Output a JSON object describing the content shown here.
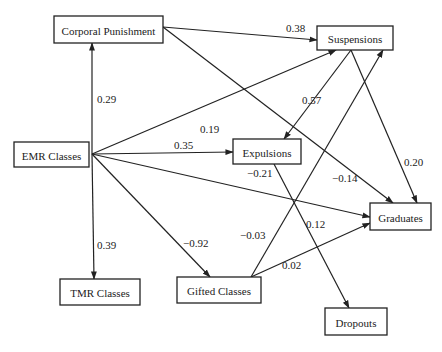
{
  "diagram": {
    "type": "path-diagram",
    "nodes": [
      {
        "id": "corporal",
        "label": "Corporal Punishment"
      },
      {
        "id": "suspensions",
        "label": "Suspensions"
      },
      {
        "id": "emr",
        "label": "EMR Classes"
      },
      {
        "id": "expulsions",
        "label": "Expulsions"
      },
      {
        "id": "graduates",
        "label": "Graduates"
      },
      {
        "id": "tmr",
        "label": "TMR Classes"
      },
      {
        "id": "gifted",
        "label": "Gifted Classes"
      },
      {
        "id": "dropouts",
        "label": "Dropouts"
      }
    ],
    "edges": [
      {
        "from": "emr",
        "to": "corporal",
        "label": "0.29"
      },
      {
        "from": "corporal",
        "to": "suspensions",
        "label": "0.38"
      },
      {
        "from": "emr",
        "to": "suspensions",
        "label": "0.19"
      },
      {
        "from": "emr",
        "to": "expulsions",
        "label": "0.35"
      },
      {
        "from": "suspensions",
        "to": "expulsions",
        "label": "0.57"
      },
      {
        "from": "emr",
        "to": "graduates",
        "label": "−0.21"
      },
      {
        "from": "corporal",
        "to": "graduates",
        "label": "−0.14"
      },
      {
        "from": "suspensions",
        "to": "graduates",
        "label": "0.20"
      },
      {
        "from": "emr",
        "to": "tmr",
        "label": "0.39"
      },
      {
        "from": "emr",
        "to": "gifted",
        "label": "−0.92"
      },
      {
        "from": "gifted",
        "to": "suspensions",
        "label": "−0.03"
      },
      {
        "from": "gifted",
        "to": "graduates",
        "label": "0.02"
      },
      {
        "from": "expulsions",
        "to": "dropouts",
        "label": "0.12"
      }
    ]
  }
}
